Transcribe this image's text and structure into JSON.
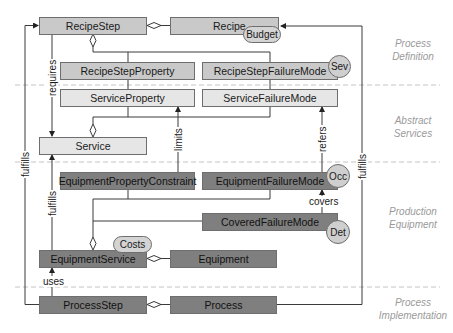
{
  "diagram": {
    "layers": [
      {
        "id": "process-definition",
        "line1": "Process",
        "line2": "Definition"
      },
      {
        "id": "abstract-services",
        "line1": "Abstract",
        "line2": "Services"
      },
      {
        "id": "production-equipment",
        "line1": "Production",
        "line2": "Equipment"
      },
      {
        "id": "process-implementation",
        "line1": "Process",
        "line2": "Implementation"
      }
    ],
    "classes": {
      "recipe_step": "RecipeStep",
      "recipe": "Recipe",
      "recipe_step_property": "RecipeStepProperty",
      "recipe_step_failure_mode": "RecipeStepFailureMode",
      "service_property": "ServiceProperty",
      "service_failure_mode": "ServiceFailureMode",
      "service": "Service",
      "equipment_property_constraint": "EquipmentPropertyConstraint",
      "equipment_failure_mode": "EquipmentFailureMode",
      "covered_failure_mode": "CoveredFailureMode",
      "equipment_service": "EquipmentService",
      "equipment": "Equipment",
      "process_step": "ProcessStep",
      "process": "Process"
    },
    "attributes": {
      "budget": "Budget",
      "sev": "Sev",
      "occ": "Occ",
      "det": "Det",
      "costs": "Costs"
    },
    "relations": {
      "requires": "requires",
      "limits": "limits",
      "refers": "refers",
      "covers": "covers",
      "fulfills_left": "fulfills",
      "fulfills_mid": "fulfills",
      "fulfills_right": "fulfills",
      "uses": "uses"
    },
    "colors": {
      "definition_fill": "#c9c9c9",
      "abstract_fill": "#e6e6e6",
      "equipment_fill": "#7f7f7f",
      "line": "#3a3a3a",
      "zone_text": "#9a9a9a"
    }
  }
}
